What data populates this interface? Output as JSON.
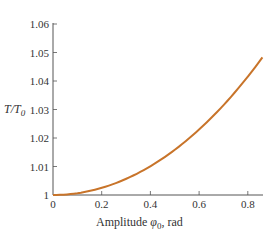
{
  "chart_data": {
    "type": "line",
    "title": "",
    "xlabel": "Amplitude φ0, rad",
    "xlabel_main": "Amplitude ",
    "xlabel_symbol": "φ",
    "xlabel_sub": "0",
    "xlabel_unit": ", rad",
    "ylabel": "T/T0",
    "ylabel_T": "T/T",
    "ylabel_sub": "0",
    "xlim": [
      0,
      0.86
    ],
    "ylim": [
      1,
      1.06
    ],
    "x_ticks": [
      "0",
      "0.2",
      "0.4",
      "0.6",
      "0.8"
    ],
    "x_tick_values": [
      0,
      0.2,
      0.4,
      0.6,
      0.8
    ],
    "y_ticks": [
      "1",
      "1.01",
      "1.02",
      "1.03",
      "1.04",
      "1.05",
      "1.06"
    ],
    "y_tick_values": [
      1,
      1.01,
      1.02,
      1.03,
      1.04,
      1.05,
      1.06
    ],
    "grid": false,
    "legend": null,
    "series": [
      {
        "name": "T/T0",
        "color": "#c8742a",
        "x": [
          0,
          0.1,
          0.2,
          0.3,
          0.4,
          0.5,
          0.6,
          0.7,
          0.8,
          0.86
        ],
        "values": [
          1.0,
          1.0006,
          1.0025,
          1.0057,
          1.0101,
          1.0159,
          1.023,
          1.0315,
          1.0413,
          1.0482
        ]
      }
    ]
  }
}
